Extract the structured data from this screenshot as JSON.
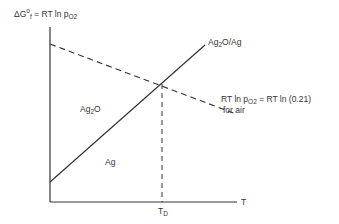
{
  "diagram": {
    "type": "Ellingham-type free energy diagram",
    "y_axis_label": {
      "prefix": "ΔG",
      "sup": "o",
      "sub": "f",
      "eq": " = RT ln p",
      "sub2": "O2"
    },
    "x_axis_label": "T",
    "x_marker_label": {
      "main": "T",
      "sub": "D"
    },
    "regions": {
      "upper": {
        "main": "Ag",
        "sub": "2",
        "tail": "O"
      },
      "lower": "Ag"
    },
    "solid_line_label": {
      "a": "Ag",
      "sub": "2",
      "b": "O/Ag"
    },
    "dashed_line_label": {
      "line1_a": "RT ln p",
      "line1_sub": "O2",
      "line1_b": " = RT ln (0.21)",
      "line2": "for air"
    },
    "colors": {
      "line": "#333333",
      "background": "#ffffff"
    }
  }
}
